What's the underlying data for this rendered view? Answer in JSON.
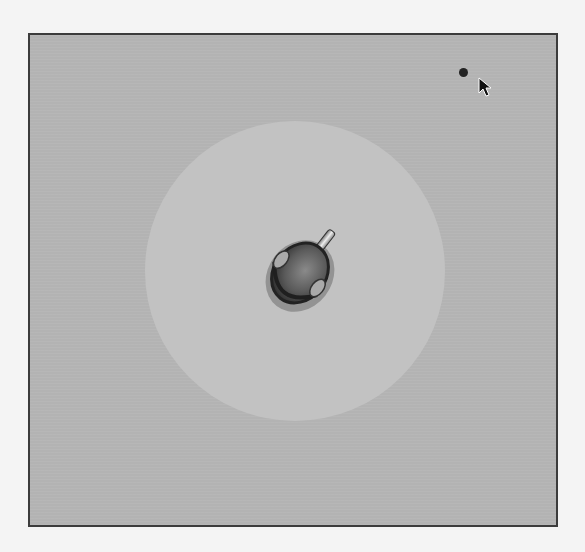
{
  "game": {
    "scene": "top-down arena",
    "colors": {
      "page_background": "#f4f4f4",
      "play_area": "#b3b3b3",
      "frame_border": "#3c3c3c",
      "arena_floor": "#c2c2c2",
      "player_body": "#5a5a5a",
      "target_dot": "#222222"
    },
    "player": {
      "x": 298,
      "y": 275,
      "facing": "up-right"
    },
    "target": {
      "x": 462,
      "y": 72
    },
    "cursor": {
      "x": 480,
      "y": 78
    }
  }
}
